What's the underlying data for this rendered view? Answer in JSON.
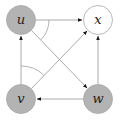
{
  "diagram": {
    "type": "directed-graph",
    "colors": {
      "shaded_fill": "#b3b3b3",
      "shaded_stroke": "#a6a6a6",
      "open_fill": "#ffffff",
      "open_stroke": "#b0b0b0",
      "edge": "#a0a0a0",
      "arrowhead": "#1a1a1a",
      "label": "#222222"
    },
    "nodes": [
      {
        "id": "u",
        "label": "u",
        "x": 21,
        "y": 20,
        "shaded": true
      },
      {
        "id": "x",
        "label": "x",
        "x": 98,
        "y": 20,
        "shaded": false
      },
      {
        "id": "v",
        "label": "v",
        "x": 21,
        "y": 99,
        "shaded": true
      },
      {
        "id": "w",
        "label": "w",
        "x": 98,
        "y": 99,
        "shaded": true
      }
    ],
    "edges": [
      {
        "from": "u",
        "to": "x"
      },
      {
        "from": "u",
        "to": "w"
      },
      {
        "from": "v",
        "to": "u"
      },
      {
        "from": "v",
        "to": "x"
      },
      {
        "from": "w",
        "to": "x"
      },
      {
        "from": "w",
        "to": "v"
      }
    ],
    "angle_marks": [
      {
        "at": "u",
        "between": [
          "u->x",
          "u->w"
        ]
      },
      {
        "at": "v",
        "between": [
          "v->u",
          "v->x"
        ]
      }
    ]
  }
}
